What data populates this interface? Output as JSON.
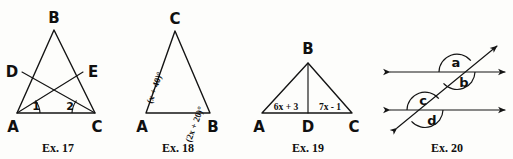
{
  "page": {
    "kind": "geometry-exercise-figures",
    "figure_count": 4
  },
  "figures": [
    {
      "id": "ex17",
      "caption": "Ex. 17",
      "shape": "triangle-with-two-cevians",
      "vertices": [
        {
          "name": "B",
          "label": "B"
        },
        {
          "name": "D",
          "label": "D"
        },
        {
          "name": "E",
          "label": "E"
        },
        {
          "name": "A",
          "label": "A"
        },
        {
          "name": "C",
          "label": "C"
        }
      ],
      "angle_marks": [
        {
          "at": "A",
          "label": "1"
        },
        {
          "at": "C",
          "label": "2"
        }
      ]
    },
    {
      "id": "ex18",
      "caption": "Ex. 18",
      "shape": "triangle",
      "vertices": [
        {
          "name": "C",
          "label": "C"
        },
        {
          "name": "A",
          "label": "A"
        },
        {
          "name": "B",
          "label": "B"
        }
      ],
      "angle_expressions": [
        {
          "at": "A",
          "text": "(x + 40)°"
        },
        {
          "at": "B",
          "text": "(2x + 20)°"
        }
      ]
    },
    {
      "id": "ex19",
      "caption": "Ex. 19",
      "shape": "triangle-with-median",
      "vertices": [
        {
          "name": "B",
          "label": "B"
        },
        {
          "name": "A",
          "label": "A"
        },
        {
          "name": "D",
          "label": "D"
        },
        {
          "name": "C",
          "label": "C"
        }
      ],
      "segment_expressions": [
        {
          "segment": "AD",
          "text": "6x + 3"
        },
        {
          "segment": "DC",
          "text": "7x - 1"
        }
      ]
    },
    {
      "id": "ex20",
      "caption": "Ex. 20",
      "shape": "two-parallel-lines-cut-by-transversal",
      "angle_labels": [
        {
          "name": "a",
          "label": "a"
        },
        {
          "name": "b",
          "label": "b"
        },
        {
          "name": "c",
          "label": "c"
        },
        {
          "name": "d",
          "label": "d"
        }
      ]
    }
  ],
  "colors": {
    "ink": "#141414",
    "paper": "#fdfdfb"
  }
}
